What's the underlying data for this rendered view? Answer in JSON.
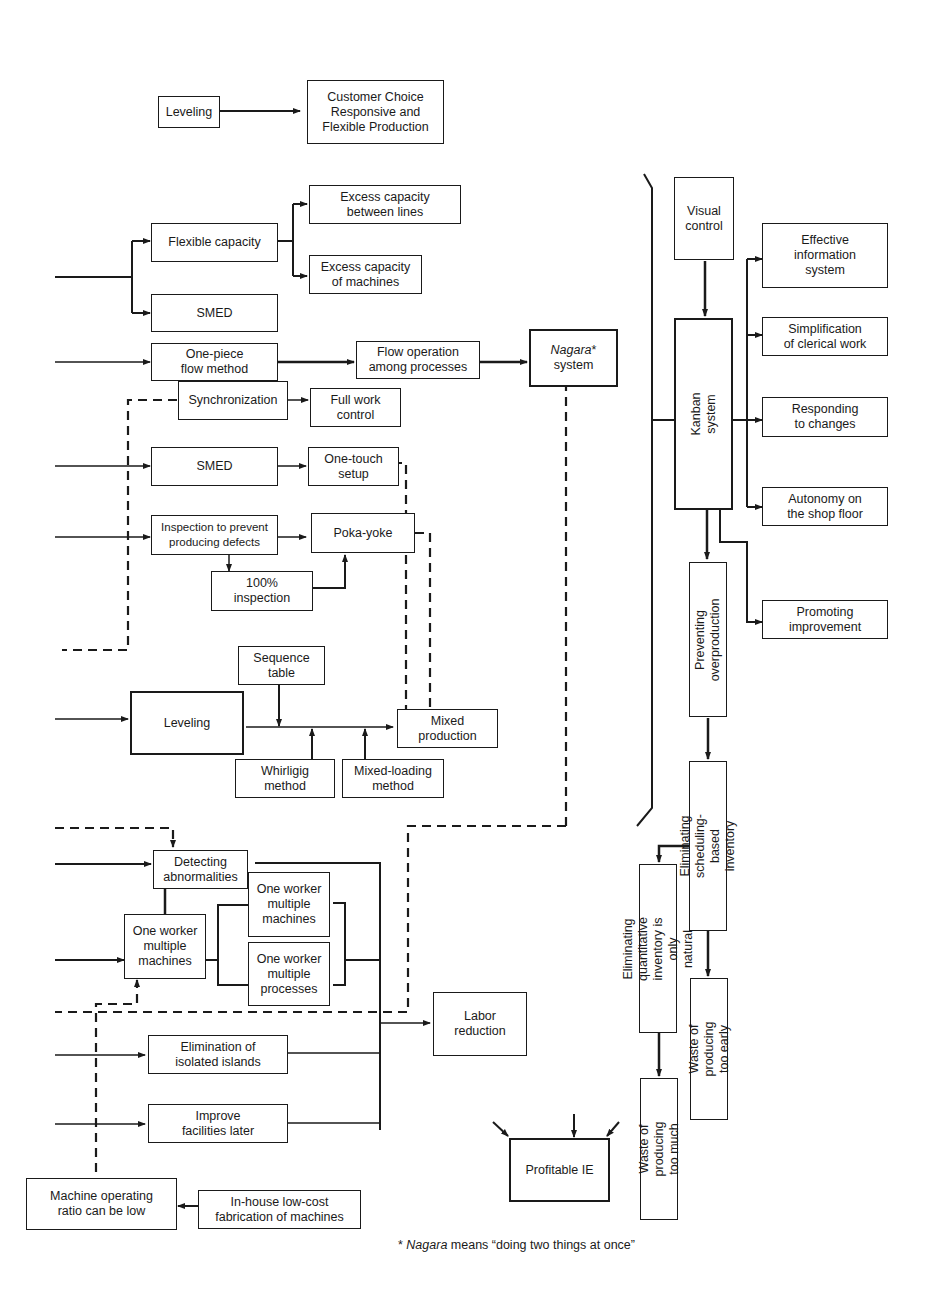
{
  "diagram": {
    "top": {
      "leveling": "Leveling",
      "customer_choice": "Customer Choice\nResponsive and\nFlexible Production"
    },
    "left": {
      "flexible_capacity": "Flexible capacity",
      "excess_between_lines": "Excess capacity\nbetween lines",
      "excess_of_machines": "Excess capacity\nof machines",
      "smed_1": "SMED",
      "one_piece_flow": "One-piece\nflow method",
      "flow_operation": "Flow operation\namong processes",
      "nagara_name": "Nagara",
      "nagara_mark": "*",
      "nagara_system": "system",
      "synchronization": "Synchronization",
      "full_work_control": "Full work\ncontrol",
      "smed_2": "SMED",
      "one_touch_setup": "One-touch\nsetup",
      "inspection_prevent": "Inspection to prevent\nproducing defects",
      "poka_yoke": "Poka-yoke",
      "inspection_100": "100%\ninspection",
      "sequence_table": "Sequence\ntable",
      "leveling_2": "Leveling",
      "mixed_production": "Mixed\nproduction",
      "whirligig": "Whirligig\nmethod",
      "mixed_loading": "Mixed-loading\nmethod",
      "detecting_abnormalities": "Detecting\nabnormalities",
      "one_worker_machines_left": "One worker\nmultiple\nmachines",
      "one_worker_machines": "One worker\nmultiple\nmachines",
      "one_worker_processes": "One worker\nmultiple\nprocesses",
      "labor_reduction": "Labor\nreduction",
      "elimination_islands": "Elimination of\nisolated islands",
      "improve_facilities": "Improve\nfacilities later",
      "machine_operating_ratio": "Machine operating\nratio can be low",
      "inhouse_fabrication": "In-house low-cost\nfabrication of machines",
      "profitable_ie": "Profitable IE"
    },
    "right": {
      "visual_control": "Visual\ncontrol",
      "kanban_system": "Kanban system",
      "effective_info": "Effective\ninformation\nsystem",
      "simplification": "Simplification\nof clerical work",
      "responding_changes": "Responding\nto changes",
      "autonomy": "Autonomy on\nthe shop floor",
      "promoting_improvement": "Promoting\nimprovement",
      "preventing_overproduction": "Preventing\noverproduction",
      "eliminating_scheduling": "Eliminating scheduling-\nbased inventory",
      "eliminating_quantitative": "Eliminating quantitative\ninventory is only natural",
      "waste_too_early": "Waste of producing\ntoo early",
      "waste_too_much": "Waste of producing\ntoo much"
    },
    "footnote": {
      "mark": "* ",
      "term": "Nagara",
      "text": " means “doing two things at once”"
    }
  }
}
